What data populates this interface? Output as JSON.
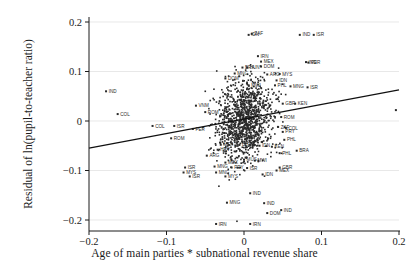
{
  "chart_data": {
    "type": "scatter",
    "title": "",
    "xlabel": "Age of main parties * subnational revenue share",
    "ylabel": "Residual of ln(pupil-to-teacher ratio)",
    "xlim": [
      -0.2,
      0.2
    ],
    "ylim": [
      -0.22,
      0.21
    ],
    "xticks": [
      "-0.2",
      "-0.1",
      "0",
      "0.1",
      "0.2"
    ],
    "xtick_values": [
      -0.2,
      -0.1,
      0,
      0.1,
      0.2
    ],
    "yticks": [
      "0.2",
      "0.1",
      "0",
      "-0.1",
      "-0.2"
    ],
    "ytick_values": [
      0.2,
      0.1,
      0,
      -0.1,
      -0.2
    ],
    "grid": "horizontal-faint",
    "legend": "none",
    "marker": "filled-square",
    "marker_color": "#2a2a2a",
    "fit_line": {
      "type": "linear",
      "color": "#111111",
      "x_start": -0.2,
      "y_start": -0.055,
      "x_end": 0.2,
      "y_end": 0.063,
      "slope": 0.295,
      "intercept": 0.004
    },
    "labeled_points": [
      {
        "label": "ZAF",
        "x": 0.01,
        "y": 0.176
      },
      {
        "label": "IDN",
        "x": 0.006,
        "y": 0.174
      },
      {
        "label": "IND",
        "x": 0.072,
        "y": 0.174
      },
      {
        "label": "ISR",
        "x": 0.09,
        "y": 0.174
      },
      {
        "label": "IRN",
        "x": 0.018,
        "y": 0.131
      },
      {
        "label": "MEX",
        "x": 0.022,
        "y": 0.12
      },
      {
        "label": "IND",
        "x": 0.08,
        "y": 0.119
      },
      {
        "label": "PER",
        "x": 0.083,
        "y": 0.118
      },
      {
        "label": "DOM",
        "x": 0.022,
        "y": 0.11
      },
      {
        "label": "BRA",
        "x": -0.002,
        "y": 0.108
      },
      {
        "label": "HUN",
        "x": 0.004,
        "y": 0.108
      },
      {
        "label": "MNG",
        "x": -0.012,
        "y": 0.096
      },
      {
        "label": "MYS",
        "x": 0.046,
        "y": 0.095
      },
      {
        "label": "ARG",
        "x": 0.03,
        "y": 0.094
      },
      {
        "label": "DOM",
        "x": -0.024,
        "y": 0.086
      },
      {
        "label": "IDN",
        "x": 0.042,
        "y": 0.082
      },
      {
        "label": "MWI",
        "x": 0.006,
        "y": 0.072
      },
      {
        "label": "PHL",
        "x": 0.04,
        "y": 0.072
      },
      {
        "label": "MNG",
        "x": 0.06,
        "y": 0.07
      },
      {
        "label": "ISR",
        "x": 0.082,
        "y": 0.068
      },
      {
        "label": "IND",
        "x": -0.178,
        "y": 0.06
      },
      {
        "label": "GBR",
        "x": 0.05,
        "y": 0.035
      },
      {
        "label": "KEN",
        "x": 0.066,
        "y": 0.035
      },
      {
        "label": "VNM",
        "x": -0.062,
        "y": 0.031
      },
      {
        "label": "ROM",
        "x": -0.05,
        "y": 0.018
      },
      {
        "label": "COL",
        "x": -0.163,
        "y": 0.014
      },
      {
        "label": "ROM",
        "x": 0.048,
        "y": 0.008
      },
      {
        "label": "COL",
        "x": -0.118,
        "y": -0.01
      },
      {
        "label": "ISR",
        "x": -0.09,
        "y": -0.01
      },
      {
        "label": "ZAF",
        "x": 0.044,
        "y": -0.012
      },
      {
        "label": "COL",
        "x": 0.054,
        "y": -0.014
      },
      {
        "label": "PER",
        "x": -0.066,
        "y": -0.016
      },
      {
        "label": "PRY",
        "x": 0.05,
        "y": -0.022
      },
      {
        "label": "ROM",
        "x": -0.094,
        "y": -0.035
      },
      {
        "label": "PHL",
        "x": 0.052,
        "y": -0.038
      },
      {
        "label": "MEX",
        "x": -0.03,
        "y": -0.048
      },
      {
        "label": "BLR",
        "x": -0.006,
        "y": -0.048
      },
      {
        "label": "IDN",
        "x": 0.02,
        "y": -0.05
      },
      {
        "label": "KEN",
        "x": 0.036,
        "y": -0.052
      },
      {
        "label": "HRV",
        "x": -0.034,
        "y": -0.058
      },
      {
        "label": "BRA",
        "x": 0.068,
        "y": -0.06
      },
      {
        "label": "PHL",
        "x": 0.046,
        "y": -0.065
      },
      {
        "label": "ARG",
        "x": -0.048,
        "y": -0.07
      },
      {
        "label": "MUS",
        "x": 0.0,
        "y": -0.078
      },
      {
        "label": "MWI",
        "x": 0.014,
        "y": -0.08
      },
      {
        "label": "MEX",
        "x": -0.024,
        "y": -0.084
      },
      {
        "label": "ISR",
        "x": -0.076,
        "y": -0.094
      },
      {
        "label": "MNG",
        "x": -0.038,
        "y": -0.092
      },
      {
        "label": "PRY",
        "x": -0.016,
        "y": -0.094
      },
      {
        "label": "ISR",
        "x": 0.004,
        "y": -0.095
      },
      {
        "label": "GBR",
        "x": 0.046,
        "y": -0.094
      },
      {
        "label": "MEX",
        "x": 0.042,
        "y": -0.1
      },
      {
        "label": "MYS",
        "x": -0.078,
        "y": -0.104
      },
      {
        "label": "MNG",
        "x": -0.036,
        "y": -0.104
      },
      {
        "label": "IDN",
        "x": 0.024,
        "y": -0.108
      },
      {
        "label": "ISR",
        "x": -0.07,
        "y": -0.112
      },
      {
        "label": "MYS",
        "x": -0.024,
        "y": -0.112
      },
      {
        "label": "IND",
        "x": 0.008,
        "y": -0.146
      },
      {
        "label": "MNG",
        "x": -0.022,
        "y": -0.165
      },
      {
        "label": "IND",
        "x": 0.026,
        "y": -0.166
      },
      {
        "label": "IND",
        "x": 0.048,
        "y": -0.18
      },
      {
        "label": "DOM",
        "x": 0.03,
        "y": -0.186
      },
      {
        "label": "IRN",
        "x": -0.036,
        "y": -0.208
      },
      {
        "label": "IRN",
        "x": 0.008,
        "y": -0.208
      },
      {
        "label": "OUT",
        "x": 0.196,
        "y": 0.022
      }
    ]
  }
}
